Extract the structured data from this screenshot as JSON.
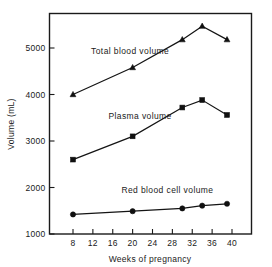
{
  "chart_data": {
    "type": "line",
    "title": "",
    "xlabel": "Weeks of pregnancy",
    "ylabel": "Volume (mL)",
    "xlim": [
      6,
      42
    ],
    "ylim": [
      1000,
      5600
    ],
    "grid": false,
    "legend_position": "inline-labels",
    "xticks": [
      8,
      12,
      16,
      20,
      24,
      28,
      32,
      36,
      40
    ],
    "xtick_labels": [
      "8",
      "12",
      "16",
      "20",
      "24",
      "28",
      "32",
      "36",
      "40"
    ],
    "yticks": [
      1000,
      2000,
      3000,
      4000,
      5000
    ],
    "ytick_labels": [
      "1000",
      "2000",
      "3000",
      "4000",
      "5000"
    ],
    "series": [
      {
        "name": "Total blood volume",
        "marker": "triangle",
        "color": "#101010",
        "x": [
          8,
          20,
          30,
          34,
          39
        ],
        "values": [
          4000,
          4580,
          5180,
          5470,
          5180
        ]
      },
      {
        "name": "Plasma volume",
        "marker": "square",
        "color": "#101010",
        "x": [
          8,
          20,
          30,
          34,
          39
        ],
        "values": [
          2600,
          3100,
          3720,
          3880,
          3560
        ]
      },
      {
        "name": "Red blood cell volume",
        "marker": "circle",
        "color": "#101010",
        "x": [
          8,
          20,
          30,
          34,
          39
        ],
        "values": [
          1420,
          1490,
          1550,
          1610,
          1650
        ]
      }
    ],
    "annotations": [
      {
        "text": "Total blood volume",
        "x": 19.5,
        "y": 4870
      },
      {
        "text": "Plasma volume",
        "x": 21.5,
        "y": 3480
      },
      {
        "text": "Red blood cell volume",
        "x": 27.0,
        "y": 1890
      }
    ]
  }
}
